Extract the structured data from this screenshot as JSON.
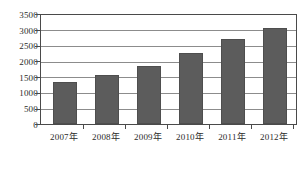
{
  "chart_data": {
    "type": "bar",
    "title": "",
    "subtitle": "",
    "xlabel": "",
    "ylabel": "",
    "categories": [
      "2007年",
      "2008年",
      "2009年",
      "2010年",
      "2011年",
      "2012年"
    ],
    "values": [
      1350,
      1560,
      1880,
      2280,
      2720,
      3080
    ],
    "series": [
      {
        "name": "",
        "values": [
          1350,
          1560,
          1880,
          2280,
          2720,
          3080
        ]
      }
    ],
    "ylim": [
      0,
      3500
    ],
    "ytick_values": [
      0,
      500,
      1000,
      1500,
      2000,
      2500,
      3000,
      3500
    ],
    "ytick_labels": [
      "0",
      "500",
      "1000",
      "1500",
      "2000",
      "2500",
      "3000",
      "3500"
    ],
    "grid": true,
    "grid_axis": "y",
    "legend": false,
    "legend_position": "none",
    "bar_color": "#5c5c5c",
    "grid_color": "#8c8c8c",
    "axis_color": "#4a4a4a",
    "background_color": "#ffffff",
    "annotations": []
  }
}
